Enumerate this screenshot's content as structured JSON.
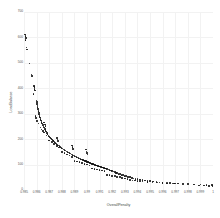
{
  "chart_data": {
    "type": "scatter",
    "title": "",
    "xlabel": "OverallPenalty",
    "ylabel": "LoadBalance",
    "xlim": [
      0.985,
      1.0
    ],
    "ylim": [
      0,
      700
    ],
    "grid": true,
    "legend": null,
    "marker_color": "#111111",
    "grid_color": "#f2f2f2",
    "xticks": [
      "0.985",
      "0.986",
      "0.987",
      "0.988",
      "0.989",
      "0.99",
      "0.991",
      "0.992",
      "0.993",
      "0.994",
      "0.995",
      "0.996",
      "0.997",
      "0.998",
      "0.999",
      "1"
    ],
    "xtick_values": [
      0.985,
      0.986,
      0.987,
      0.988,
      0.989,
      0.99,
      0.991,
      0.992,
      0.993,
      0.994,
      0.995,
      0.996,
      0.997,
      0.998,
      0.999,
      1.0
    ],
    "yticks": [
      "0",
      "100",
      "200",
      "300",
      "400",
      "500",
      "600",
      "700"
    ],
    "ytick_values": [
      0,
      100,
      200,
      300,
      400,
      500,
      600,
      700
    ],
    "points": [
      [
        0.9851,
        612
      ],
      [
        0.98512,
        605
      ],
      [
        0.98515,
        598
      ],
      [
        0.98513,
        590
      ],
      [
        0.9852,
        560
      ],
      [
        0.98522,
        552
      ],
      [
        0.98545,
        498
      ],
      [
        0.9856,
        455
      ],
      [
        0.98562,
        448
      ],
      [
        0.9858,
        410
      ],
      [
        0.98582,
        404
      ],
      [
        0.98584,
        398
      ],
      [
        0.98586,
        392
      ],
      [
        0.98575,
        378
      ],
      [
        0.986,
        352
      ],
      [
        0.98602,
        345
      ],
      [
        0.98604,
        338
      ],
      [
        0.98606,
        332
      ],
      [
        0.98608,
        326
      ],
      [
        0.98612,
        318
      ],
      [
        0.98615,
        310
      ],
      [
        0.98618,
        303
      ],
      [
        0.98621,
        297
      ],
      [
        0.98624,
        291
      ],
      [
        0.98628,
        285
      ],
      [
        0.98632,
        279
      ],
      [
        0.98636,
        273
      ],
      [
        0.9864,
        267
      ],
      [
        0.98645,
        261
      ],
      [
        0.9865,
        255
      ],
      [
        0.98655,
        250
      ],
      [
        0.9866,
        245
      ],
      [
        0.98665,
        240
      ],
      [
        0.9867,
        235
      ],
      [
        0.98676,
        230
      ],
      [
        0.98682,
        225
      ],
      [
        0.98688,
        220
      ],
      [
        0.98694,
        215
      ],
      [
        0.987,
        211
      ],
      [
        0.98707,
        207
      ],
      [
        0.98714,
        203
      ],
      [
        0.98721,
        199
      ],
      [
        0.98728,
        195
      ],
      [
        0.98735,
        192
      ],
      [
        0.98742,
        188
      ],
      [
        0.9875,
        184
      ],
      [
        0.98758,
        181
      ],
      [
        0.98766,
        178
      ],
      [
        0.98774,
        175
      ],
      [
        0.98782,
        172
      ],
      [
        0.9879,
        169
      ],
      [
        0.98798,
        166
      ],
      [
        0.98806,
        163
      ],
      [
        0.98814,
        160
      ],
      [
        0.98822,
        158
      ],
      [
        0.9883,
        155
      ],
      [
        0.98838,
        152
      ],
      [
        0.98846,
        150
      ],
      [
        0.98854,
        147
      ],
      [
        0.98862,
        145
      ],
      [
        0.9887,
        143
      ],
      [
        0.98878,
        140
      ],
      [
        0.98886,
        138
      ],
      [
        0.98894,
        136
      ],
      [
        0.98902,
        134
      ],
      [
        0.9891,
        132
      ],
      [
        0.98918,
        130
      ],
      [
        0.98926,
        128
      ],
      [
        0.98934,
        126
      ],
      [
        0.98942,
        124
      ],
      [
        0.9895,
        122
      ],
      [
        0.98958,
        120
      ],
      [
        0.98966,
        118
      ],
      [
        0.98974,
        116
      ],
      [
        0.98982,
        115
      ],
      [
        0.9899,
        113
      ],
      [
        0.98998,
        111
      ],
      [
        0.99006,
        110
      ],
      [
        0.99014,
        108
      ],
      [
        0.99022,
        106
      ],
      [
        0.9903,
        105
      ],
      [
        0.99038,
        103
      ],
      [
        0.99046,
        102
      ],
      [
        0.99054,
        100
      ],
      [
        0.99062,
        99
      ],
      [
        0.9907,
        97
      ],
      [
        0.99078,
        96
      ],
      [
        0.99086,
        94
      ],
      [
        0.99094,
        93
      ],
      [
        0.99102,
        92
      ],
      [
        0.9911,
        90
      ],
      [
        0.99118,
        89
      ],
      [
        0.99126,
        88
      ],
      [
        0.99134,
        86
      ],
      [
        0.99142,
        85
      ],
      [
        0.9915,
        84
      ],
      [
        0.9916,
        82
      ],
      [
        0.9917,
        80
      ],
      [
        0.9918,
        78
      ],
      [
        0.9919,
        76
      ],
      [
        0.992,
        74
      ],
      [
        0.9921,
        72
      ],
      [
        0.9922,
        70
      ],
      [
        0.9923,
        68
      ],
      [
        0.9924,
        66
      ],
      [
        0.9925,
        64
      ],
      [
        0.99262,
        62
      ],
      [
        0.99274,
        60
      ],
      [
        0.99286,
        58
      ],
      [
        0.99298,
        56
      ],
      [
        0.9931,
        54
      ],
      [
        0.99325,
        52
      ],
      [
        0.9934,
        50
      ],
      [
        0.99355,
        48
      ],
      [
        0.9937,
        46
      ],
      [
        0.99385,
        44
      ],
      [
        0.994,
        43
      ],
      [
        0.9942,
        41
      ],
      [
        0.9944,
        39
      ],
      [
        0.9946,
        38
      ],
      [
        0.9948,
        36
      ],
      [
        0.995,
        35
      ],
      [
        0.99525,
        33
      ],
      [
        0.9955,
        32
      ],
      [
        0.99575,
        30
      ],
      [
        0.996,
        29
      ],
      [
        0.9963,
        28
      ],
      [
        0.9966,
        27
      ],
      [
        0.9969,
        26
      ],
      [
        0.9899,
        160
      ],
      [
        0.98995,
        152
      ],
      [
        0.99,
        146
      ],
      [
        0.99005,
        140
      ],
      [
        0.9888,
        175
      ],
      [
        0.98885,
        168
      ],
      [
        0.9889,
        162
      ],
      [
        0.9876,
        205
      ],
      [
        0.98765,
        198
      ],
      [
        0.9877,
        192
      ],
      [
        0.9866,
        265
      ],
      [
        0.98665,
        258
      ],
      [
        0.9867,
        252
      ],
      [
        0.9972,
        25
      ],
      [
        0.9976,
        24
      ],
      [
        0.998,
        23
      ],
      [
        0.9985,
        22
      ],
      [
        0.999,
        21
      ],
      [
        0.9995,
        20
      ],
      [
        0.9999,
        19
      ],
      [
        0.9944,
        33
      ],
      [
        0.9948,
        31
      ],
      [
        0.9952,
        30
      ],
      [
        0.9956,
        29
      ],
      [
        0.996,
        28
      ],
      [
        0.9964,
        27
      ],
      [
        0.9968,
        26
      ],
      [
        0.997,
        25
      ],
      [
        0.9934,
        40
      ],
      [
        0.9936,
        38
      ],
      [
        0.9938,
        37
      ],
      [
        0.994,
        36
      ],
      [
        0.9942,
        35
      ],
      [
        0.9916,
        60
      ],
      [
        0.9918,
        58
      ],
      [
        0.992,
        56
      ],
      [
        0.9922,
        54
      ],
      [
        0.9924,
        52
      ],
      [
        0.9926,
        50
      ],
      [
        0.9928,
        48
      ],
      [
        0.993,
        46
      ],
      [
        0.9932,
        44
      ],
      [
        0.9904,
        85
      ],
      [
        0.9906,
        83
      ],
      [
        0.9908,
        81
      ],
      [
        0.991,
        79
      ],
      [
        0.9912,
        77
      ],
      [
        0.9914,
        75
      ],
      [
        0.989,
        115
      ],
      [
        0.9892,
        112
      ],
      [
        0.9894,
        109
      ],
      [
        0.9896,
        106
      ],
      [
        0.9898,
        103
      ],
      [
        0.99,
        100
      ],
      [
        0.9902,
        97
      ],
      [
        0.988,
        150
      ],
      [
        0.9882,
        145
      ],
      [
        0.9884,
        140
      ],
      [
        0.9886,
        135
      ],
      [
        0.9888,
        130
      ],
      [
        0.987,
        195
      ],
      [
        0.9872,
        188
      ],
      [
        0.9874,
        181
      ],
      [
        0.9876,
        174
      ],
      [
        0.9878,
        167
      ],
      [
        0.9863,
        245
      ],
      [
        0.9864,
        238
      ],
      [
        0.9865,
        232
      ],
      [
        0.9866,
        226
      ],
      [
        0.9868,
        215
      ],
      [
        0.9859,
        290
      ],
      [
        0.98595,
        282
      ],
      [
        0.98605,
        272
      ],
      [
        0.98615,
        262
      ],
      [
        0.9989,
        18
      ],
      [
        0.9993,
        17
      ],
      [
        0.9997,
        16
      ],
      [
        1.0,
        15
      ]
    ]
  }
}
